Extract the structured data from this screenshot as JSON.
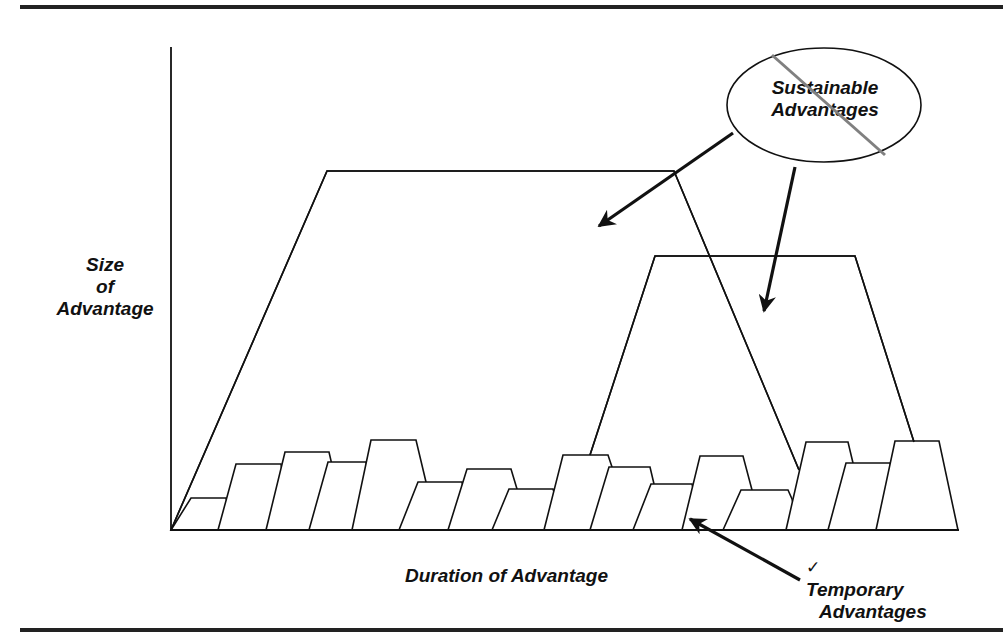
{
  "diagram": {
    "y_axis_label": [
      "Size",
      "of",
      "Advantage"
    ],
    "x_axis_label": "Duration of Advantage",
    "sustainable_callout": {
      "line1": "Sustainable",
      "line2": "Advantages",
      "struck_through": true
    },
    "temporary_callout": {
      "check_icon": "✓",
      "line1": "Temporary",
      "line2": "Advantages"
    },
    "colors": {
      "line": "#111111",
      "strike": "#808080",
      "rule": "#222222"
    },
    "large_trapezoids": [
      {
        "name": "sustainable-advantage-1",
        "points": [
          [
            171,
            530
          ],
          [
            327,
            171
          ],
          [
            674,
            171
          ],
          [
            799,
            470
          ]
        ]
      },
      {
        "name": "sustainable-advantage-2",
        "points": [
          [
            590,
            455
          ],
          [
            655,
            256
          ],
          [
            855,
            256
          ],
          [
            914,
            442
          ]
        ]
      }
    ],
    "small_trapezoids_tops": [
      498,
      464,
      452,
      462,
      440,
      482,
      469,
      489,
      455,
      467,
      484,
      456,
      490,
      442,
      463,
      441
    ],
    "small_trapezoid_count": 16
  }
}
